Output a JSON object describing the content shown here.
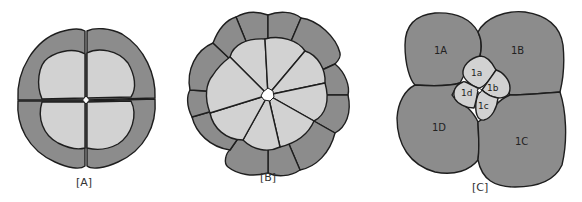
{
  "figure": {
    "panels": [
      {
        "id": "A",
        "caption": "[A]",
        "description": "4-cell stage, radial cleavage, top view"
      },
      {
        "id": "B",
        "caption": "[B]",
        "description": "8-cell stage, radial cleavage, top view"
      },
      {
        "id": "C",
        "caption": "[C]",
        "description": "8-cell stage, spiral cleavage"
      }
    ],
    "panel_c_labels": {
      "macromeres": [
        "1A",
        "1B",
        "1C",
        "1D"
      ],
      "micromeres": [
        "1a",
        "1b",
        "1c",
        "1d"
      ]
    },
    "colors": {
      "dark_fill": "#8c8c8c",
      "light_fill": "#d2d2d2",
      "outline": "#1e1e1e",
      "background": "#ffffff"
    }
  }
}
